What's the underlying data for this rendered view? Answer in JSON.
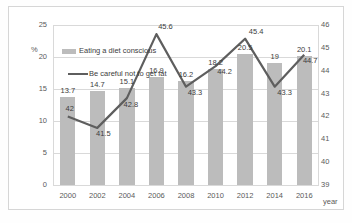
{
  "chart_data": {
    "type": "bar",
    "title": "",
    "xlabel": "year",
    "ylabel": "%",
    "y2label": "",
    "categories": [
      "2000",
      "2002",
      "2004",
      "2006",
      "2008",
      "2010",
      "2012",
      "2014",
      "2016"
    ],
    "ylim": [
      0,
      25
    ],
    "yticks": [
      "0",
      "5",
      "10",
      "15",
      "20",
      "25"
    ],
    "y2lim": [
      39,
      46
    ],
    "y2ticks": [
      "39",
      "40",
      "41",
      "42",
      "43",
      "44",
      "45",
      "46"
    ],
    "grid": true,
    "legend_position": "upper-left-inside",
    "series": [
      {
        "name": "Eating a diet conscious",
        "type": "bar",
        "axis": "left",
        "color": "#bcbcbc",
        "values": [
          13.7,
          14.7,
          15.1,
          16.9,
          16.2,
          18.2,
          20.5,
          19,
          20.1
        ],
        "labels": [
          "13.7",
          "14.7",
          "15.1",
          "16.9",
          "16.2",
          "18.2",
          "20.5",
          "19",
          "20.1"
        ]
      },
      {
        "name": "Be careful not to get fat",
        "type": "line",
        "axis": "right",
        "color": "#5e5e5e",
        "values": [
          42,
          41.5,
          42.8,
          45.6,
          43.3,
          44.2,
          45.4,
          43.3,
          44.7
        ],
        "labels": [
          "42",
          "41.5",
          "42.8",
          "45.6",
          "43.3",
          "44.2",
          "45.4",
          "43.3",
          "44.7"
        ]
      }
    ]
  },
  "legend": {
    "bar_label": "Eating a diet conscious",
    "line_label": "Be careful not to get fat"
  }
}
